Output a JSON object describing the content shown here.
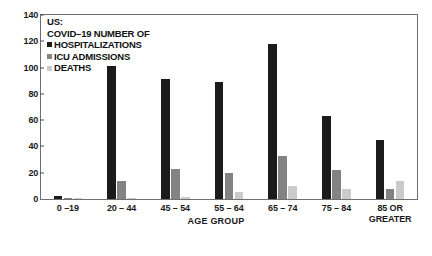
{
  "chart_data": {
    "type": "bar",
    "subtitle": "",
    "xlabel": "AGE GROUP",
    "ylabel": "",
    "ylim": [
      0,
      140
    ],
    "yticks": [
      0,
      20,
      40,
      60,
      80,
      100,
      120,
      140
    ],
    "grid": false,
    "legend_position": "top-left inside plot",
    "categories": [
      "0 –19",
      "20 – 44",
      "45 – 54",
      "55 – 64",
      "65 – 74",
      "75 – 84",
      "85 OR\nGREATER"
    ],
    "series": [
      {
        "name": "HOSPITALIZATIONS",
        "color": "#1b1b1b",
        "values": [
          2,
          101,
          91,
          89,
          118,
          63,
          45
        ]
      },
      {
        "name": "ICU ADMISSIONS",
        "color": "#838383",
        "values": [
          0.3,
          14,
          23,
          20,
          33,
          22,
          8
        ]
      },
      {
        "name": "DEATHS",
        "color": "#cbcbcb",
        "values": [
          0.1,
          1,
          1.5,
          5.5,
          10,
          8,
          14
        ]
      }
    ]
  },
  "chart": {
    "title_line1": "US:",
    "title_line2": "COVID–19 NUMBER OF",
    "x_axis_title": "AGE GROUP",
    "legend": [
      {
        "label": "HOSPITALIZATIONS",
        "color": "#1b1b1b"
      },
      {
        "label": "ICU ADMISSIONS",
        "color": "#838383"
      },
      {
        "label": "DEATHS",
        "color": "#cbcbcb"
      }
    ],
    "y_ticks": [
      "140",
      "120",
      "100",
      "80",
      "60",
      "40",
      "20",
      "0"
    ],
    "x_ticks": [
      "0 –19",
      "20 – 44",
      "45 – 54",
      "55 – 64",
      "65 – 74",
      "75 – 84",
      "85 OR\nGREATER"
    ]
  }
}
